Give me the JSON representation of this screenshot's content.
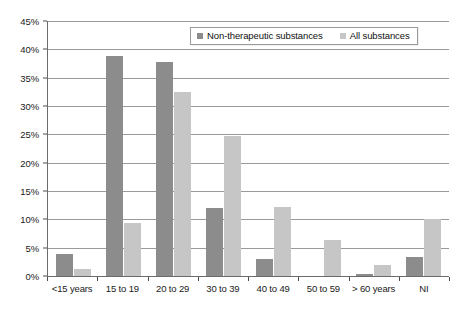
{
  "chart_data": {
    "type": "bar",
    "title": "",
    "subtitle": "",
    "xlabel": "",
    "ylabel": "",
    "categories": [
      "<15 years",
      "15 to 19",
      "20 to 29",
      "30 to 39",
      "40 to 49",
      "50 to 59",
      "> 60 years",
      "NI"
    ],
    "series": [
      {
        "name": "Non-therapeutic substances",
        "color": "#8c8c8c",
        "values": [
          3.9,
          38.9,
          37.8,
          12.0,
          3.0,
          0.0,
          0.3,
          3.3
        ]
      },
      {
        "name": "All substances",
        "color": "#c6c6c6",
        "values": [
          1.3,
          9.4,
          32.4,
          24.7,
          12.2,
          6.4,
          2.0,
          10.0
        ]
      }
    ],
    "ylim": [
      0,
      45
    ],
    "ytick_step": 5,
    "ytick_labels": [
      "0%",
      "5%",
      "10%",
      "15%",
      "20%",
      "25%",
      "30%",
      "35%",
      "40%",
      "45%"
    ],
    "ytick_values": [
      0,
      5,
      10,
      15,
      20,
      25,
      30,
      35,
      40,
      45
    ],
    "grid": true,
    "grid_axis": "y",
    "legend_position": "top-right",
    "legend_border": true,
    "background": "#ffffff"
  }
}
